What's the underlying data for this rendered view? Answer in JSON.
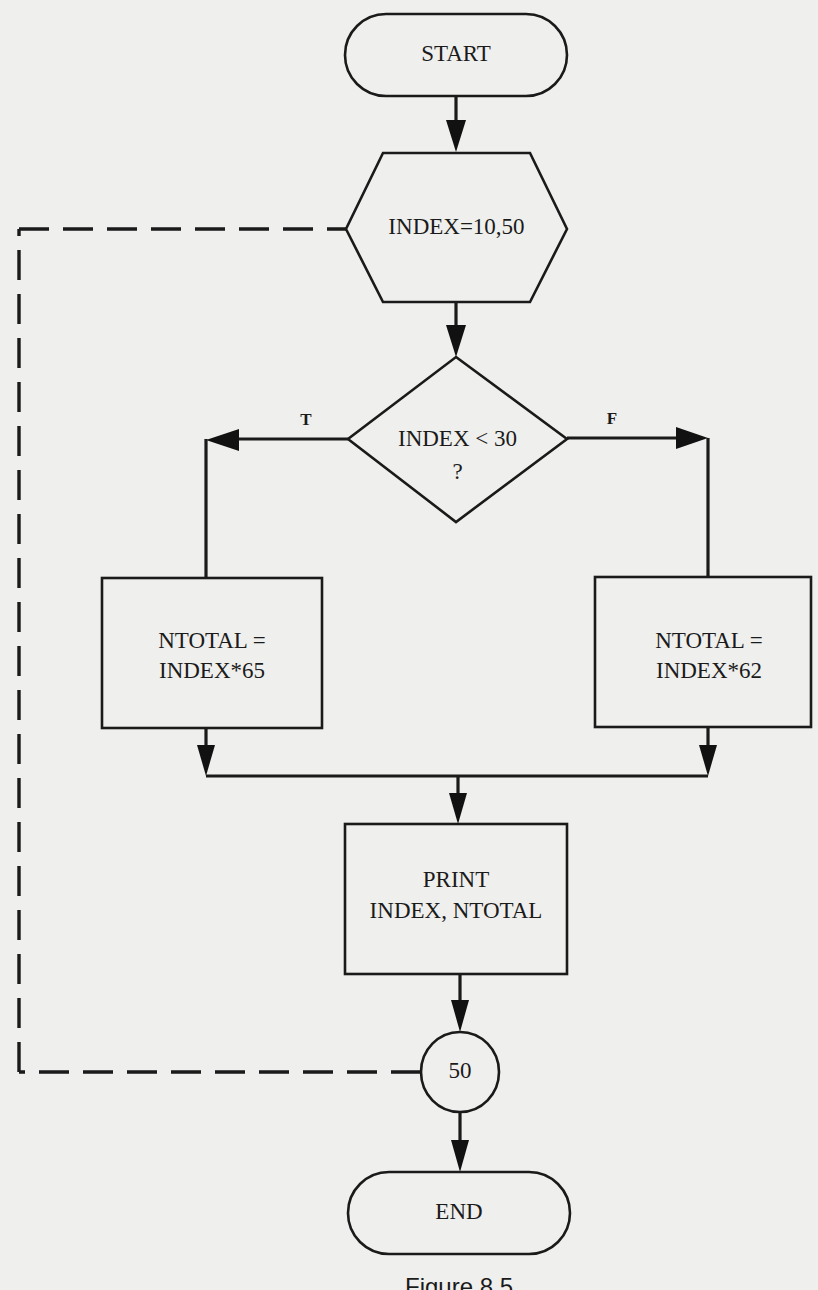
{
  "diagram": {
    "type": "flowchart",
    "colors": {
      "background": "#efefed",
      "ink": "#1a1a1a"
    },
    "nodes": {
      "start": {
        "shape": "terminal",
        "label": "START"
      },
      "loop": {
        "shape": "hexagon",
        "label": "INDEX=10,50"
      },
      "decision": {
        "shape": "diamond",
        "line1": "INDEX < 30",
        "line2": "?"
      },
      "true_process": {
        "shape": "rectangle",
        "line1": "NTOTAL =",
        "line2": "INDEX*65"
      },
      "false_process": {
        "shape": "rectangle",
        "line1": "NTOTAL =",
        "line2": "INDEX*62"
      },
      "print": {
        "shape": "rectangle",
        "line1": "PRINT",
        "line2": "INDEX, NTOTAL"
      },
      "connector": {
        "shape": "circle",
        "label": "50"
      },
      "end": {
        "shape": "terminal",
        "label": "END"
      }
    },
    "branches": {
      "true_label": "T",
      "false_label": "F"
    },
    "edges": [
      {
        "from": "start",
        "to": "loop",
        "style": "solid-arrow"
      },
      {
        "from": "loop",
        "to": "decision",
        "style": "solid-arrow"
      },
      {
        "from": "decision",
        "to": "true_process",
        "label": "T",
        "style": "solid-arrow"
      },
      {
        "from": "decision",
        "to": "false_process",
        "label": "F",
        "style": "solid-arrow"
      },
      {
        "from": "true_process",
        "to": "print",
        "style": "solid-arrow"
      },
      {
        "from": "false_process",
        "to": "print",
        "style": "solid-arrow"
      },
      {
        "from": "print",
        "to": "connector",
        "style": "solid-arrow"
      },
      {
        "from": "connector",
        "to": "loop",
        "style": "dashed-loop-back"
      },
      {
        "from": "connector",
        "to": "end",
        "style": "solid-arrow"
      }
    ],
    "caption": "Figure 8.5"
  }
}
